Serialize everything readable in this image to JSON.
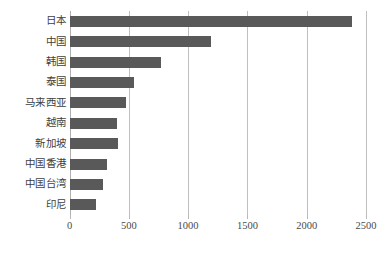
{
  "chart_data": {
    "type": "bar",
    "orientation": "horizontal",
    "title": "",
    "subtitle": "",
    "xlabel": "",
    "ylabel": "",
    "categories": [
      "日本",
      "中国",
      "韩国",
      "泰国",
      "马来西亚",
      "越南",
      "新加坡",
      "中国香港",
      "中国台湾",
      "印尼"
    ],
    "values": [
      2380,
      1190,
      770,
      545,
      475,
      400,
      410,
      315,
      285,
      220
    ],
    "series": [
      {
        "name": "",
        "values": [
          2380,
          1190,
          770,
          545,
          475,
          400,
          410,
          315,
          285,
          220
        ]
      }
    ],
    "xlim": [
      0,
      2500
    ],
    "xticks": [
      0,
      500,
      1000,
      1500,
      2000,
      2500
    ],
    "xtick_labels": [
      "0",
      "500",
      "1000",
      "1500",
      "2000",
      "2500"
    ],
    "grid": "vertical",
    "legend": "none",
    "bar_color": "#595959",
    "gridline_color": "#bfbfbf",
    "background_color": "#ffffff",
    "annotations": []
  }
}
